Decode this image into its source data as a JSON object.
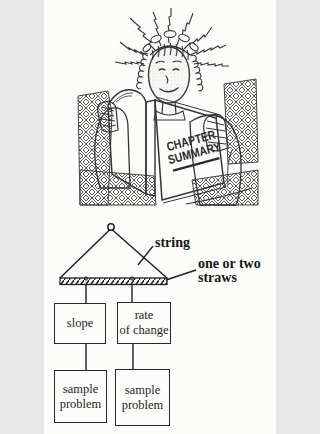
{
  "colors": {
    "ink": "#2f2f2f",
    "paper": "#fcfcfa",
    "face_stipple": "#b0b0b0"
  },
  "illustration": {
    "cover_line1": "CHAPTER",
    "cover_line2": "SUMMARY"
  },
  "diagram": {
    "string_label": "string",
    "straws_line1": "one or two",
    "straws_line2": "straws",
    "boxes": {
      "slope": {
        "line1": "slope"
      },
      "rate": {
        "line1": "rate",
        "line2": "of change"
      },
      "sample_left": {
        "line1": "sample",
        "line2": "problem"
      },
      "sample_right": {
        "line1": "sample",
        "line2": "problem"
      }
    }
  }
}
